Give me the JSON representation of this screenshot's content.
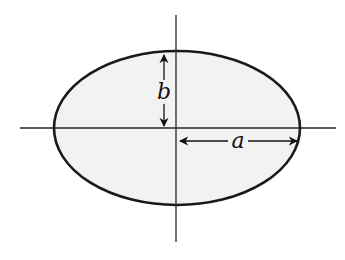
{
  "diagram": {
    "type": "ellipse",
    "labels": {
      "semi_major": "a",
      "semi_minor": "b"
    },
    "colors": {
      "fill": "#f2f2f2",
      "stroke": "#1a1a1a",
      "background": "#ffffff"
    }
  }
}
